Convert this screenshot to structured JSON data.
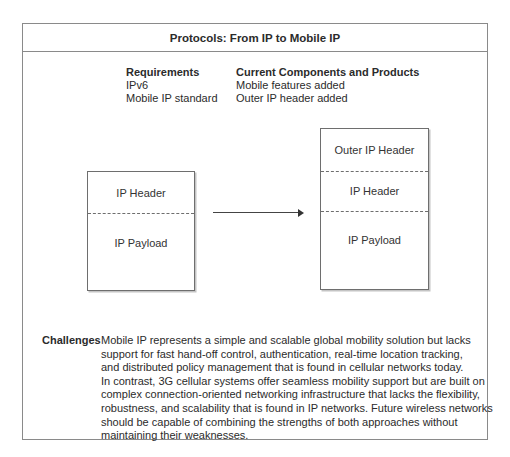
{
  "title": "Protocols: From IP to Mobile IP",
  "requirements": {
    "heading": "Requirements",
    "items": [
      "IPv6",
      "Mobile IP standard"
    ]
  },
  "current": {
    "heading": "Current Components and Products",
    "items": [
      "Mobile features added",
      "Outer IP header added"
    ]
  },
  "left_packet": {
    "segments": [
      "IP Header",
      "IP Payload"
    ]
  },
  "right_packet": {
    "segments": [
      "Outer IP Header",
      "IP Header",
      "IP Payload"
    ]
  },
  "challenges": {
    "label": "Challenges",
    "lines": [
      "Mobile IP represents a simple and scalable global mobility solution but lacks",
      "support for fast hand-off control, authentication, real-time location tracking,",
      "and distributed policy management that is found in cellular networks today.",
      "In contrast, 3G cellular systems offer seamless mobility support but are built on",
      "complex connection-oriented networking infrastructure that lacks the flexibility,",
      "robustness, and scalability that is found in IP networks. Future wireless networks",
      "should be capable of combining the strengths of both approaches without",
      "maintaining their weaknesses."
    ]
  }
}
